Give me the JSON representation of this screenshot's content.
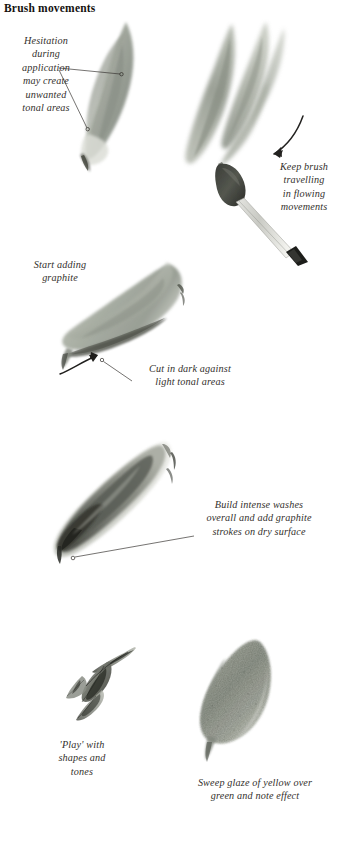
{
  "page": {
    "title": "Brush movements",
    "background_color": "#ffffff",
    "width": 352,
    "height": 856
  },
  "palette": {
    "ink": "#33302c",
    "title_ink": "#15120f",
    "leaf_grey_green_light": "#c2c6bc",
    "leaf_grey_green_mid": "#9aa095",
    "leaf_grey_green_dark": "#6e746b",
    "graphite_dark": "#4a4d48",
    "graphite_black": "#1f201e",
    "wash_warm_grey": "#b9b6ab",
    "leader_line": "#3a3733"
  },
  "captions": [
    {
      "id": "hesitation",
      "text": "Hesitation\nduring\napplication\nmay create\nunwanted\ntonal areas",
      "align": "center"
    },
    {
      "id": "keep-brush",
      "text": "Keep brush\ntravelling\nin flowing\nmovements",
      "align": "center"
    },
    {
      "id": "start-adding-graphite",
      "text": "Start adding\ngraphite",
      "align": "center"
    },
    {
      "id": "cut-in-dark",
      "text": "Cut in dark against\nlight tonal areas",
      "align": "center"
    },
    {
      "id": "build-intense-washes",
      "text": "Build intense washes\noverall and add graphite\nstrokes on dry surface",
      "align": "center"
    },
    {
      "id": "play-with-shapes",
      "text": "'Play' with\nshapes and\ntones",
      "align": "center"
    },
    {
      "id": "sweep-glaze",
      "text": "Sweep glaze of yellow over\ngreen and note effect",
      "align": "center"
    }
  ],
  "illustrations": [
    {
      "id": "leaf-pointed-upright",
      "label": "pointed upright leaf brushstroke"
    },
    {
      "id": "leaf-pair-upright",
      "label": "pair of upright leaf brushstrokes"
    },
    {
      "id": "paintbrush",
      "label": "paintbrush with loaded tip"
    },
    {
      "id": "leaf-horizontal-graphite",
      "label": "horizontal leaf with graphite shading"
    },
    {
      "id": "leaf-diagonal-dark",
      "label": "dark diagonal leaf with intense washes"
    },
    {
      "id": "leaf-cluster-sketch",
      "label": "loose cluster of leaf shapes"
    },
    {
      "id": "leaf-textured-glaze",
      "label": "textured leaf with yellow glaze over green"
    }
  ],
  "annotations": [
    {
      "id": "leader-hesitation-upper",
      "type": "leader-line-with-dot"
    },
    {
      "id": "leader-hesitation-lower",
      "type": "leader-line-with-dot"
    },
    {
      "id": "arrow-keep-brush",
      "type": "curved-arrow"
    },
    {
      "id": "arrow-cut-in-dark",
      "type": "curved-arrow"
    },
    {
      "id": "leader-cut-in-dark",
      "type": "leader-line-with-dot"
    },
    {
      "id": "leader-build-washes",
      "type": "leader-line-with-dot"
    }
  ]
}
